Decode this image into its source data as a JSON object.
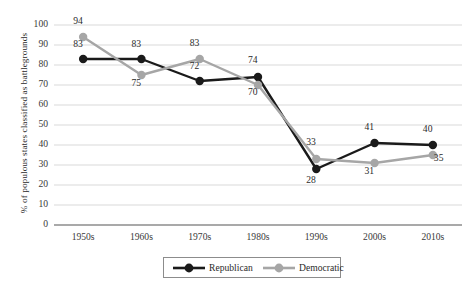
{
  "chart_data": {
    "type": "line",
    "title": "",
    "xlabel": "",
    "ylabel": "% of populous states classified as battlegrounds",
    "categories": [
      "1950s",
      "1960s",
      "1970s",
      "1980s",
      "1990s",
      "2000s",
      "2010s"
    ],
    "series": [
      {
        "name": "Republican",
        "color": "#1a1a1a",
        "values": [
          83,
          83,
          72,
          74,
          28,
          41,
          40
        ]
      },
      {
        "name": "Democratic",
        "color": "#a6a6a6",
        "values": [
          94,
          75,
          83,
          70,
          33,
          31,
          35
        ]
      }
    ],
    "ylim": [
      0,
      100
    ],
    "ytick_step": 10,
    "yticks": [
      "0",
      "10",
      "20",
      "30",
      "40",
      "50",
      "60",
      "70",
      "80",
      "90",
      "100"
    ],
    "grid": true,
    "legend_position": "bottom-center"
  },
  "legend": {
    "items": [
      {
        "label": "Republican",
        "marker": "filled-circle-marker",
        "color": "#1a1a1a"
      },
      {
        "label": "Democratic",
        "marker": "filled-circle-marker",
        "color": "#a6a6a6"
      }
    ]
  },
  "data_labels": {
    "republican": [
      "83",
      "83",
      "72",
      "74",
      "28",
      "41",
      "40"
    ],
    "democratic": [
      "94",
      "75",
      "83",
      "70",
      "33",
      "31",
      "35"
    ]
  },
  "colors": {
    "republican": "#1a1a1a",
    "democratic": "#a6a6a6",
    "grid": "#cfcfcf",
    "axis": "#8c8c8c",
    "text": "#2b2b2b",
    "background": "#ffffff"
  }
}
